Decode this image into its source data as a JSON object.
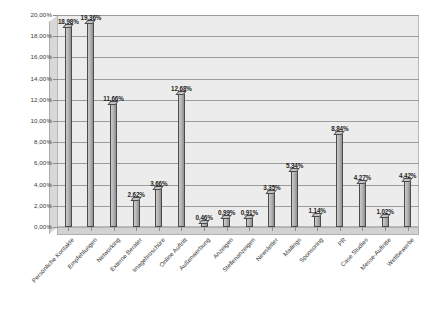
{
  "chart_data": {
    "type": "bar",
    "title": "",
    "subtitle": "",
    "xlabel": "",
    "ylabel": "",
    "ylim": [
      0,
      20
    ],
    "grid": true,
    "legend": "none",
    "y_tick_labels": [
      "20,00%",
      "18,00%",
      "16,00%",
      "14,00%",
      "12,00%",
      "10,00%",
      "8,00%",
      "6,00%",
      "4,00%",
      "2,00%",
      "0,00%"
    ],
    "y_tick_values": [
      20,
      18,
      16,
      14,
      12,
      10,
      8,
      6,
      4,
      2,
      0
    ],
    "categories": [
      "Persönliche Kontakte",
      "Empfehlungen",
      "Networking",
      "Externe Berater",
      "Imagebroschüre",
      "Online Auftritt",
      "Außenwerbung",
      "Anzeigen",
      "Stellenanzeigen",
      "Newsletter",
      "Mailings",
      "Sponsoring",
      "PR",
      "Case Studies",
      "Messe-Auftritte",
      "Wettbewerbe"
    ],
    "values": [
      18.98,
      19.36,
      11.66,
      2.62,
      3.66,
      12.68,
      0.46,
      0.99,
      0.91,
      3.35,
      5.34,
      1.14,
      8.84,
      4.27,
      1.02,
      4.42
    ],
    "value_labels": [
      "18,98%",
      "19,36%",
      "11,66%",
      "2,62%",
      "3,66%",
      "12,68%",
      "0,46%",
      "0,99%",
      "0,91%",
      "3,35%",
      "5,34%",
      "1,14%",
      "8,84%",
      "4,27%",
      "1,02%",
      "4,42%"
    ],
    "colors": {
      "bar_face": "#b6b6b6",
      "bar_edge": "#4a4a4a",
      "plot_background": "#ececec",
      "gridline": "#9c9c9c",
      "text": "#3a3a3a"
    }
  }
}
